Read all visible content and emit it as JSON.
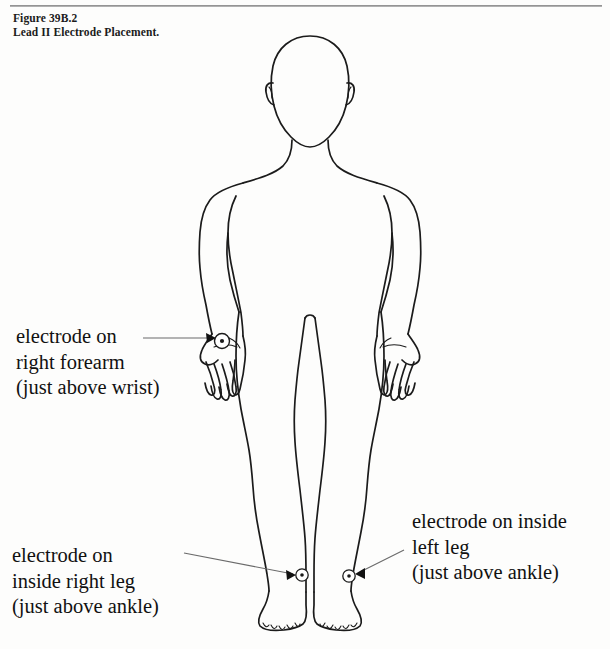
{
  "figure": {
    "caption_number": "Figure 39B.2",
    "caption_title": "Lead II Electrode Placement."
  },
  "annotations": {
    "forearm": {
      "line1": "electrode on",
      "line2": "right forearm",
      "line3": "(just above wrist)"
    },
    "right_leg": {
      "line1": "electrode on",
      "line2": "inside right leg",
      "line3": "(just above ankle)"
    },
    "left_leg": {
      "line1": "electrode on inside",
      "line2": "left leg",
      "line3": "(just above ankle)"
    }
  },
  "electrodes": [
    {
      "name": "right-forearm-electrode",
      "x": 222,
      "y": 341
    },
    {
      "name": "right-leg-electrode",
      "x": 302,
      "y": 575
    },
    {
      "name": "left-leg-electrode",
      "x": 349,
      "y": 576
    }
  ],
  "colors": {
    "page_background": "#fdfdfc",
    "ink": "#1b1b1b",
    "rule": "#8d8d8d",
    "leader_line": "#5a5a5a",
    "arrowhead": "#111111"
  }
}
